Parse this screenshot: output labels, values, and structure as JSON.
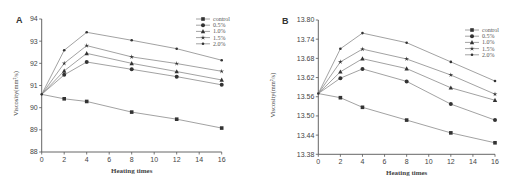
{
  "chart_data": [
    {
      "type": "line",
      "panel_label": "A",
      "title": "",
      "xlabel": "Heating times",
      "ylabel": "Viscosity(mm²/s)",
      "x": [
        0,
        2,
        4,
        8,
        12,
        16
      ],
      "xlim": [
        0,
        16
      ],
      "ylim": [
        88,
        94
      ],
      "xticks": [
        0,
        2,
        4,
        6,
        8,
        10,
        12,
        14,
        16
      ],
      "yticks": [
        88,
        89,
        90,
        91,
        92,
        93,
        94
      ],
      "ytick_labels": [
        "88",
        "89",
        "90",
        "91",
        "92",
        "93",
        "94"
      ],
      "grid": false,
      "legend_position": "top-right",
      "series": [
        {
          "name": "control",
          "marker": "square",
          "values": [
            90.6,
            90.4,
            90.28,
            89.8,
            89.48,
            89.08
          ]
        },
        {
          "name": "0.5%",
          "marker": "circle",
          "values": [
            90.6,
            91.48,
            92.06,
            91.73,
            91.4,
            91.03
          ]
        },
        {
          "name": "1.0%",
          "marker": "triangle",
          "values": [
            90.6,
            91.66,
            92.45,
            92.0,
            91.63,
            91.25
          ]
        },
        {
          "name": "1.5%",
          "marker": "star",
          "values": [
            90.6,
            92.0,
            92.8,
            92.29,
            91.99,
            91.64
          ]
        },
        {
          "name": "2.0%",
          "marker": "dot",
          "values": [
            90.6,
            92.59,
            93.4,
            93.04,
            92.66,
            92.14
          ]
        }
      ]
    },
    {
      "type": "line",
      "panel_label": "B",
      "title": "",
      "xlabel": "Heating times",
      "ylabel": "Viscosity(mm²/s)",
      "x": [
        0,
        2,
        4,
        8,
        12,
        16
      ],
      "xlim": [
        0,
        16
      ],
      "ylim": [
        13.38,
        13.8
      ],
      "xticks": [
        0,
        2,
        4,
        6,
        8,
        10,
        12,
        14,
        16
      ],
      "yticks": [
        13.38,
        13.44,
        13.5,
        13.56,
        13.62,
        13.68,
        13.74,
        13.8
      ],
      "ytick_labels": [
        "13.38",
        "13.44",
        "13.50",
        "13.56",
        "13.62",
        "13.68",
        "13.74",
        "13.80"
      ],
      "grid": false,
      "legend_position": "top-right",
      "series": [
        {
          "name": "control",
          "marker": "square",
          "values": [
            13.57,
            13.557,
            13.527,
            13.487,
            13.447,
            13.416
          ]
        },
        {
          "name": "0.5%",
          "marker": "circle",
          "values": [
            13.57,
            13.618,
            13.647,
            13.608,
            13.537,
            13.487
          ]
        },
        {
          "name": "1.0%",
          "marker": "triangle",
          "values": [
            13.57,
            13.638,
            13.679,
            13.648,
            13.588,
            13.549
          ]
        },
        {
          "name": "1.5%",
          "marker": "star",
          "values": [
            13.57,
            13.669,
            13.709,
            13.678,
            13.628,
            13.568
          ]
        },
        {
          "name": "2.0%",
          "marker": "dot",
          "values": [
            13.57,
            13.71,
            13.759,
            13.729,
            13.669,
            13.609
          ]
        }
      ]
    }
  ]
}
